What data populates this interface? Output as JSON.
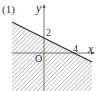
{
  "figure": {
    "label": "(1)",
    "y_axis_label": "y",
    "x_axis_label": "x",
    "origin_label": "O",
    "y_intercept_label": "2",
    "x_intercept_label": "4",
    "line": {
      "y_intercept": 2,
      "x_intercept": 4,
      "equation": "y = -x/2 + 2"
    },
    "shaded_region": "below line (hatched)",
    "colors": {
      "line": "#333333",
      "hatch": "#777777",
      "axis": "#555555"
    }
  }
}
